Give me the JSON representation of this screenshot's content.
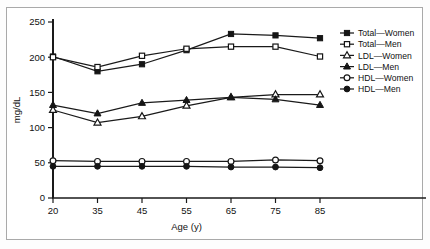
{
  "figure": {
    "background": "#ffffff",
    "frame_color": "#a9a9a9",
    "ink_color": "#151515"
  },
  "axes": {
    "x_title": "Age (y)",
    "y_title": "mg/dL",
    "x_ticks": [
      "20",
      "35",
      "45",
      "55",
      "65",
      "75",
      "85"
    ],
    "y_ticks": [
      "0",
      "50",
      "100",
      "150",
      "200",
      "250"
    ]
  },
  "legend": {
    "position": "right",
    "entries": [
      {
        "label": "Total—Women",
        "marker": "filled-square"
      },
      {
        "label": "Total—Men",
        "marker": "open-square"
      },
      {
        "label": "LDL—Women",
        "marker": "open-triangle"
      },
      {
        "label": "LDL—Men",
        "marker": "filled-triangle"
      },
      {
        "label": "HDL—Women",
        "marker": "open-circle"
      },
      {
        "label": "HDL—Men",
        "marker": "filled-circle"
      }
    ]
  },
  "chart_data": {
    "type": "line",
    "title": "",
    "xlabel": "Age (y)",
    "ylabel": "mg/dL",
    "xlim": [
      20,
      85
    ],
    "ylim": [
      0,
      250
    ],
    "grid": false,
    "legend_position": "right",
    "x": [
      20,
      35,
      45,
      55,
      65,
      75,
      85
    ],
    "xtick_labels": [
      "20",
      "35",
      "45",
      "55",
      "65",
      "75",
      "85"
    ],
    "ytick_labels": [
      "0",
      "50",
      "100",
      "150",
      "200",
      "250"
    ],
    "series": [
      {
        "name": "Total—Women",
        "marker": "filled-square",
        "values": [
          201,
          180,
          190,
          210,
          233,
          231,
          227
        ]
      },
      {
        "name": "Total—Men",
        "marker": "open-square",
        "values": [
          200,
          186,
          202,
          212,
          215,
          215,
          201
        ]
      },
      {
        "name": "LDL—Women",
        "marker": "open-triangle",
        "values": [
          125,
          107,
          116,
          131,
          143,
          147,
          147
        ]
      },
      {
        "name": "LDL—Men",
        "marker": "filled-triangle",
        "values": [
          132,
          120,
          135,
          139,
          143,
          140,
          132
        ]
      },
      {
        "name": "HDL—Women",
        "marker": "open-circle",
        "values": [
          53,
          52,
          52,
          52,
          52,
          54,
          53
        ]
      },
      {
        "name": "HDL—Men",
        "marker": "filled-circle",
        "values": [
          45,
          45,
          45,
          45,
          44,
          44,
          43
        ]
      }
    ]
  }
}
